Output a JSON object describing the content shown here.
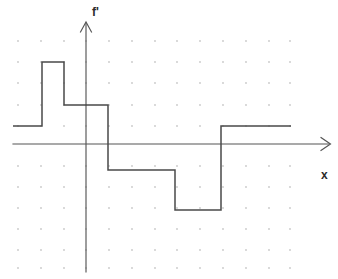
{
  "figure": {
    "kind": "step-function-plot",
    "background_color": "#ffffff",
    "curve_color": "#4a4a4a",
    "axis_color": "#555555",
    "grid_dot_color": "#c8c8c8",
    "labels": {
      "y_axis": "f'",
      "x_axis": "x"
    }
  },
  "chart_data": {
    "type": "line",
    "title": "",
    "xlabel": "x",
    "ylabel": "f'",
    "grid": "dotted",
    "legend": "none",
    "axis_ranges": {
      "x": [
        -3,
        9
      ],
      "y": [
        -5,
        5
      ]
    },
    "grid_spacing_units": 1,
    "origin_pixel": [
      86,
      144
    ],
    "pixels_per_unit": {
      "x": 22.8,
      "y": 20.8
    },
    "step_segments": [
      {
        "x_start": -3.2,
        "x_end": -1.9,
        "y": 0.9
      },
      {
        "x_start": -1.9,
        "x_end": -1.0,
        "y": 3.9
      },
      {
        "x_start": -1.0,
        "x_end": 1.0,
        "y": 1.9
      },
      {
        "x_start": 1.0,
        "x_end": 3.9,
        "y": -1.3
      },
      {
        "x_start": 3.9,
        "x_end": 5.9,
        "y": -3.2
      },
      {
        "x_start": 5.9,
        "x_end": 9.0,
        "y": 0.9
      }
    ],
    "vertices_pixels": [
      [
        13,
        126
      ],
      [
        42,
        126
      ],
      [
        42,
        62
      ],
      [
        64,
        62
      ],
      [
        64,
        105
      ],
      [
        108,
        105
      ],
      [
        108,
        170
      ],
      [
        175,
        170
      ],
      [
        175,
        210
      ],
      [
        221,
        210
      ],
      [
        221,
        126
      ],
      [
        291,
        126
      ]
    ],
    "jump_discontinuities_x": [
      -1.9,
      -1.0,
      1.0,
      3.9,
      5.9
    ],
    "x_axis_pixel_y": 144,
    "y_axis_pixel_x": 86
  },
  "grid": {
    "dot_columns_px": [
      18,
      41,
      64,
      86,
      109,
      132,
      155,
      177,
      200,
      223,
      246,
      269,
      290
    ],
    "dot_rows_px": [
      41,
      62,
      83,
      105,
      126,
      166,
      187,
      208,
      229,
      250,
      268
    ],
    "dot_radius_px": 0.9
  }
}
